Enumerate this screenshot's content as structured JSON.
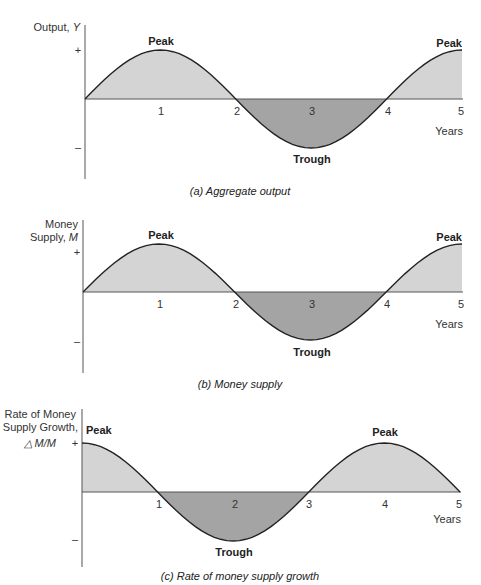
{
  "chart_data": [
    {
      "type": "area",
      "title": "(a) Aggregate output",
      "ylabel": "Output, Y",
      "xlabel": "Years",
      "x_ticks": [
        "1",
        "2",
        "3",
        "4",
        "5"
      ],
      "y_ticks": [
        "+",
        "–"
      ],
      "annotations": [
        {
          "text": "Peak",
          "x": 1
        },
        {
          "text": "Trough",
          "x": 3
        },
        {
          "text": "Peak",
          "x": 5
        }
      ],
      "x": [
        0,
        1,
        2,
        3,
        4,
        5
      ],
      "values": [
        0,
        1,
        0,
        -1,
        0,
        1
      ],
      "shape": "sine, period 4 years, starts at 0 rising",
      "fill_positive": "#d4d4d4",
      "fill_negative": "#a4a4a4",
      "grid": false
    },
    {
      "type": "area",
      "title": "(b) Money supply",
      "ylabel": "Money Supply, M",
      "xlabel": "Years",
      "x_ticks": [
        "1",
        "2",
        "3",
        "4",
        "5"
      ],
      "y_ticks": [
        "+",
        "–"
      ],
      "annotations": [
        {
          "text": "Peak",
          "x": 1
        },
        {
          "text": "Trough",
          "x": 3
        },
        {
          "text": "Peak",
          "x": 5
        }
      ],
      "x": [
        0,
        1,
        2,
        3,
        4,
        5
      ],
      "values": [
        0,
        1,
        0,
        -1,
        0,
        1
      ],
      "shape": "sine, period 4 years, starts at 0 rising",
      "fill_positive": "#d4d4d4",
      "fill_negative": "#a4a4a4",
      "grid": false
    },
    {
      "type": "area",
      "title": "(c) Rate of money supply growth",
      "ylabel": "Rate of Money Supply Growth, ΔM/M",
      "xlabel": "Years",
      "x_ticks": [
        "1",
        "2",
        "3",
        "4",
        "5"
      ],
      "y_ticks": [
        "+",
        "–"
      ],
      "annotations": [
        {
          "text": "Peak",
          "x": 0
        },
        {
          "text": "Trough",
          "x": 2
        },
        {
          "text": "Peak",
          "x": 4
        }
      ],
      "x": [
        0,
        1,
        2,
        3,
        4,
        5
      ],
      "values": [
        1,
        0,
        -1,
        0,
        1,
        0
      ],
      "shape": "cosine, period 4 years, starts at peak",
      "fill_positive": "#d4d4d4",
      "fill_negative": "#a4a4a4",
      "grid": false
    }
  ],
  "panels": {
    "a": {
      "ylabel1": "Output, ",
      "ylabel_var": "Y",
      "plus": "+",
      "minus": "–",
      "peak1": "Peak",
      "trough": "Trough",
      "peak2": "Peak",
      "years": "Years",
      "caption": "(a) Aggregate output",
      "ticks": [
        "1",
        "2",
        "3",
        "4",
        "5"
      ]
    },
    "b": {
      "ylabel1": "Money",
      "ylabel2": "Supply, ",
      "ylabel_var": "M",
      "plus": "+",
      "minus": "–",
      "peak1": "Peak",
      "trough": "Trough",
      "peak2": "Peak",
      "years": "Years",
      "caption": "(b) Money supply",
      "ticks": [
        "1",
        "2",
        "3",
        "4",
        "5"
      ]
    },
    "c": {
      "ylabel1": "Rate of Money",
      "ylabel2": "Supply Growth,",
      "ylabel3": "△ M/M",
      "plus": "+",
      "minus": "–",
      "peak1": "Peak",
      "trough": "Trough",
      "peak2": "Peak",
      "years": "Years",
      "caption": "(c) Rate of money supply growth",
      "ticks": [
        "1",
        "2",
        "3",
        "4",
        "5"
      ]
    }
  }
}
